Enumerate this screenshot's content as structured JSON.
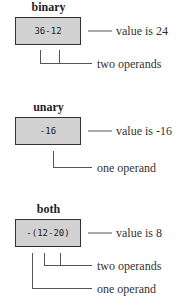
{
  "diagram": {
    "sections": [
      {
        "title": "binary",
        "expression": "36-12",
        "value_label": "value is 24",
        "annotations": [
          "two operands"
        ]
      },
      {
        "title": "unary",
        "expression": "-16",
        "value_label": "value is -16",
        "annotations": [
          "one operand"
        ]
      },
      {
        "title": "both",
        "expression": "-(12-20)",
        "value_label": "value is 8",
        "annotations": [
          "two operands",
          "one operand"
        ]
      }
    ]
  },
  "colors": {
    "box_fill": "#d2d2d2",
    "box_border": "#333333",
    "line": "#555555"
  }
}
